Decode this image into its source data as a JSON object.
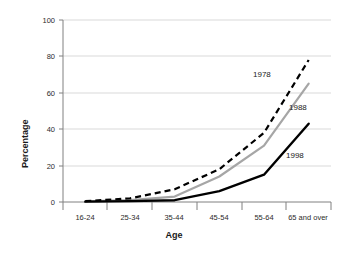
{
  "chart_data": {
    "type": "line",
    "title": "",
    "xlabel": "Age",
    "ylabel": "Percentage",
    "categories": [
      "16-24",
      "25-34",
      "35-44",
      "45-54",
      "55-64",
      "65 and over"
    ],
    "ylim": [
      0,
      100
    ],
    "yticks": [
      0,
      20,
      40,
      60,
      80,
      100
    ],
    "ytick_labels": [
      "0",
      "20",
      "40",
      "60",
      "80",
      "100"
    ],
    "grid": true,
    "grid_axis": "y",
    "legend": "inline-series-labels",
    "series": [
      {
        "name": "1978",
        "label": "1978",
        "style": "dashed",
        "color": "#000000",
        "values": [
          0.5,
          2,
          7,
          18,
          38,
          78
        ]
      },
      {
        "name": "1988",
        "label": "1988",
        "style": "solid",
        "color": "#a6a6a6",
        "values": [
          0.3,
          1,
          3,
          14,
          31,
          65
        ]
      },
      {
        "name": "1998",
        "label": "1998",
        "style": "solid",
        "color": "#000000",
        "values": [
          0.2,
          0.5,
          1,
          6,
          15,
          43
        ]
      }
    ]
  },
  "axes": {
    "y_title": "Percentage",
    "x_title": "Age"
  },
  "ytick_labels": [
    "100",
    "80",
    "60",
    "40",
    "20",
    "0"
  ],
  "xtick_labels": [
    "16-24",
    "25-34",
    "35-44",
    "45-54",
    "55-64",
    "65 and over"
  ],
  "series_labels": {
    "s1978": "1978",
    "s1988": "1988",
    "s1998": "1998"
  }
}
